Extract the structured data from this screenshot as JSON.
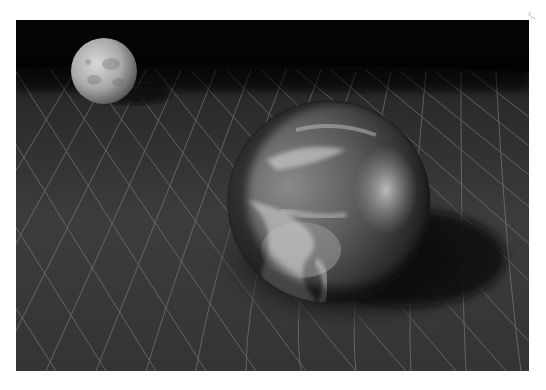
{
  "image": {
    "subject": "Earth and Moon resting on a curved spacetime grid",
    "style": "grayscale 3D render",
    "frame": {
      "x": 16,
      "y": 20,
      "width": 513,
      "height": 351
    },
    "colors": {
      "page_background": "#ffffff",
      "sky": "#050505",
      "grid_plane": "#3a3a3a",
      "grid_lines": "#8c8c8c",
      "shadow": "#111111"
    },
    "objects": [
      {
        "name": "moon",
        "cx": 88,
        "cy": 51,
        "r": 33
      },
      {
        "name": "earth",
        "cx": 313,
        "cy": 182,
        "r": 101
      }
    ],
    "corner_mark": {
      "x": 526,
      "y": 6
    }
  }
}
